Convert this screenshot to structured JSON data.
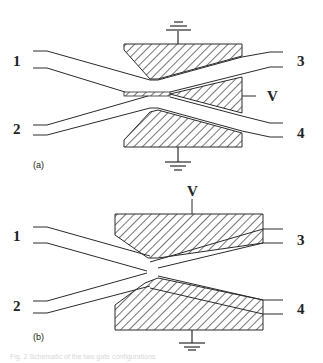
{
  "figure": {
    "panels": [
      {
        "id": "a",
        "label": "(a)",
        "terminals": {
          "t1": "1",
          "t2": "2",
          "t3": "3",
          "t4": "4"
        },
        "voltage_label": "V",
        "voltage_position": "right middle electrode",
        "grounds": [
          "top electrode",
          "bottom electrode"
        ]
      },
      {
        "id": "b",
        "label": "(b)",
        "terminals": {
          "t1": "1",
          "t2": "2",
          "t3": "3",
          "t4": "4"
        },
        "voltage_label": "V",
        "voltage_position": "top electrode",
        "grounds": [
          "bottom electrode"
        ]
      }
    ],
    "caption": "Fig. 2  Schematic of the two gate configurations"
  },
  "colors": {
    "line": "#2a2a2a",
    "background": "#ffffff",
    "caption": "#d8d8d8"
  }
}
